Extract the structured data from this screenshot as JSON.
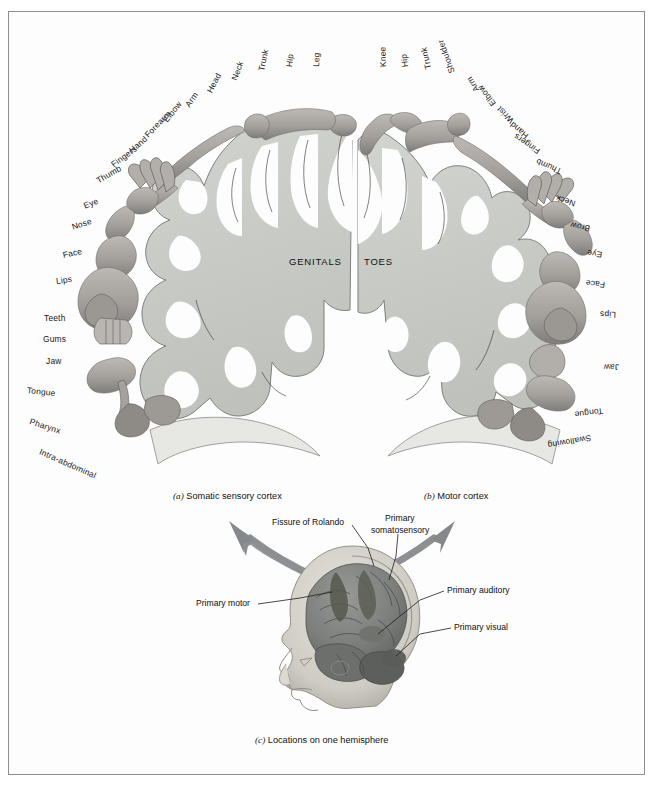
{
  "figure": {
    "title_hidden": "Penfield homunculus: sensory and motor cortex maps",
    "midline_labels": [
      {
        "text": "GENITALS",
        "x": 289,
        "y": 256
      },
      {
        "text": "TOES",
        "x": 364,
        "y": 256
      }
    ],
    "captions": [
      {
        "id": "a",
        "marker": "(a)",
        "text": "Somatic sensory cortex",
        "x": 173,
        "y": 491
      },
      {
        "id": "b",
        "marker": "(b)",
        "text": "Motor cortex",
        "x": 424,
        "y": 491
      },
      {
        "id": "c",
        "marker": "(c)",
        "text": "Locations on one hemisphere",
        "x": 255,
        "y": 735
      }
    ],
    "sensory_labels": [
      {
        "text": "Leg",
        "x": 316,
        "y": 62,
        "rot": -88
      },
      {
        "text": "Hip",
        "x": 289,
        "y": 62,
        "rot": -84
      },
      {
        "text": "Trunk",
        "x": 261,
        "y": 66,
        "rot": -78
      },
      {
        "text": "Neck",
        "x": 234,
        "y": 75,
        "rot": -70
      },
      {
        "text": "Head",
        "x": 209,
        "y": 87,
        "rot": -62
      },
      {
        "text": "Arm",
        "x": 187,
        "y": 101,
        "rot": -56
      },
      {
        "text": "Elbow",
        "x": 165,
        "y": 116,
        "rot": -52
      },
      {
        "text": "Forearm",
        "x": 146,
        "y": 131,
        "rot": -46
      },
      {
        "text": "Hand",
        "x": 130,
        "y": 146,
        "rot": -40
      },
      {
        "text": "Fingers",
        "x": 112,
        "y": 160,
        "rot": -36
      },
      {
        "text": "Thumb",
        "x": 97,
        "y": 176,
        "rot": -30
      },
      {
        "text": "Eye",
        "x": 84,
        "y": 201,
        "rot": -22
      },
      {
        "text": "Nose",
        "x": 72,
        "y": 222,
        "rot": -18
      },
      {
        "text": "Face",
        "x": 63,
        "y": 250,
        "rot": -12
      },
      {
        "text": "Lips",
        "x": 56,
        "y": 276,
        "rot": -8
      },
      {
        "text": "Teeth",
        "x": 44,
        "y": 313,
        "rot": 0
      },
      {
        "text": "Gums",
        "x": 43,
        "y": 334,
        "rot": 0
      },
      {
        "text": "Jaw",
        "x": 46,
        "y": 356,
        "rot": 0
      },
      {
        "text": "Tongue",
        "x": 27,
        "y": 385,
        "rot": 6
      },
      {
        "text": "Pharynx",
        "x": 30,
        "y": 416,
        "rot": 18
      },
      {
        "text": "Intra-abdominal",
        "x": 40,
        "y": 446,
        "rot": 24
      }
    ],
    "motor_labels": [
      {
        "text": "Knee",
        "x": 383,
        "y": 62,
        "rot": 82
      },
      {
        "text": "Hip",
        "x": 405,
        "y": 62,
        "rot": 78
      },
      {
        "text": "Trunk",
        "x": 428,
        "y": 64,
        "rot": 72
      },
      {
        "text": "Shoulder",
        "x": 452,
        "y": 68,
        "rot": 66
      },
      {
        "text": "Arm",
        "x": 477,
        "y": 86,
        "rot": 58
      },
      {
        "text": "Elbow",
        "x": 494,
        "y": 100,
        "rot": 52
      },
      {
        "text": "Wrist",
        "x": 512,
        "y": 117,
        "rot": 46
      },
      {
        "text": "Hand",
        "x": 527,
        "y": 132,
        "rot": 40
      },
      {
        "text": "Fingers",
        "x": 539,
        "y": 147,
        "rot": 34
      },
      {
        "text": "Thumb",
        "x": 561,
        "y": 167,
        "rot": 24
      },
      {
        "text": "Neck",
        "x": 575,
        "y": 199,
        "rot": 18
      },
      {
        "text": "Brow",
        "x": 590,
        "y": 224,
        "rot": 12
      },
      {
        "text": "Eye",
        "x": 602,
        "y": 250,
        "rot": 8
      },
      {
        "text": "Face",
        "x": 605,
        "y": 280,
        "rot": 6
      },
      {
        "text": "Lips",
        "x": 616,
        "y": 310,
        "rot": 2
      },
      {
        "text": "Jaw",
        "x": 619,
        "y": 362,
        "rot": -2
      },
      {
        "text": "Tongue",
        "x": 603,
        "y": 406,
        "rot": -8
      },
      {
        "text": "Swallowing",
        "x": 591,
        "y": 433,
        "rot": -10
      }
    ],
    "hemisphere_callouts": [
      {
        "text": "Fissure of Rolando",
        "x": 272,
        "y": 523,
        "align": "left"
      },
      {
        "text": "Primary",
        "x": 385,
        "y": 519,
        "align": "left"
      },
      {
        "text": "somatosensory",
        "x": 372,
        "y": 530,
        "align": "left"
      },
      {
        "text": "Primary motor",
        "x": 198,
        "y": 602,
        "align": "left"
      },
      {
        "text": "Primary auditory",
        "x": 447,
        "y": 589,
        "align": "left"
      },
      {
        "text": "Primary visual",
        "x": 454,
        "y": 626,
        "align": "left"
      }
    ],
    "colors": {
      "border": "#8d8d8d",
      "page_background": "#ffffff",
      "cortex_fill": "#c9cbc6",
      "cortex_stroke": "#6f7270",
      "body_fill": "#a9a7a3",
      "body_shade": "#7d7b78",
      "arrow": "#8d9092",
      "brain_dark": "#6a6c6a",
      "brain_mid": "#8b8d8a",
      "skin": "#d9d6cf",
      "text": "#111111"
    }
  }
}
